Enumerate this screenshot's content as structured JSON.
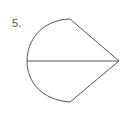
{
  "problem": {
    "number_label": "5."
  },
  "figure": {
    "stroke_color": "#555555",
    "top_point": [
      70,
      19
    ],
    "bottom_point": [
      70,
      102
    ],
    "left_point": [
      27,
      61
    ],
    "apex_point": [
      119,
      61
    ]
  }
}
